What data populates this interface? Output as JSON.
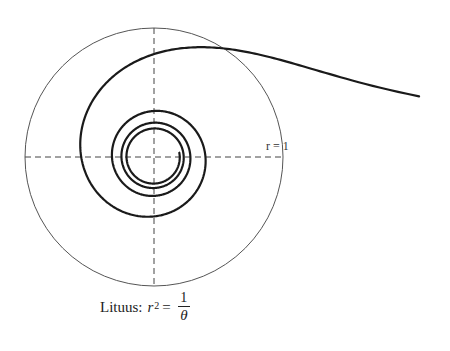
{
  "figure": {
    "center": {
      "x": 154,
      "y": 157
    },
    "unit_radius_px": 129,
    "unit_circle_label": "r = 1",
    "axes": {
      "style": "dashed",
      "color": "#444444"
    },
    "curve": {
      "equation": "r^2 = 1/θ",
      "theta_start": 0.225,
      "theta_end": 25.3,
      "stroke": "#1a1a1a",
      "stroke_width": 2.2
    },
    "circle": {
      "stroke": "#555555",
      "stroke_width": 1
    }
  },
  "caption": {
    "prefix": "Lituus:",
    "lhs_var": "r",
    "lhs_exp": "2",
    "equals": "=",
    "numerator": "1",
    "denominator": "θ"
  }
}
